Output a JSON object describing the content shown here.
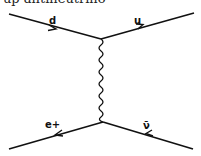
{
  "caption": "up antineutrino",
  "colors": {
    "line": "#111111",
    "text": "#111111",
    "background": "#ffffff"
  },
  "diagram": {
    "type": "feynman",
    "vertices": [
      {
        "id": "top",
        "x": 101,
        "y": 39
      },
      {
        "id": "bottom",
        "x": 103,
        "y": 122
      }
    ],
    "propagator": {
      "type": "wavy",
      "label": "W boson",
      "from": "top",
      "to": "bottom"
    },
    "particles": [
      {
        "label": "d",
        "from": [
          9,
          14
        ],
        "to": [
          101,
          39
        ],
        "arrow": "forward"
      },
      {
        "label": "u",
        "from": [
          101,
          39
        ],
        "to": [
          194,
          13
        ],
        "arrow": "forward"
      },
      {
        "label": "e+",
        "from": [
          103,
          122
        ],
        "to": [
          9,
          149
        ],
        "arrow": "forward"
      },
      {
        "label": "ν̄",
        "from": [
          193,
          149
        ],
        "to": [
          103,
          122
        ],
        "arrow": "forward"
      }
    ],
    "labels": {
      "d": "d",
      "u": "u",
      "e_plus": "e+",
      "antineutrino": "ν̄"
    }
  }
}
